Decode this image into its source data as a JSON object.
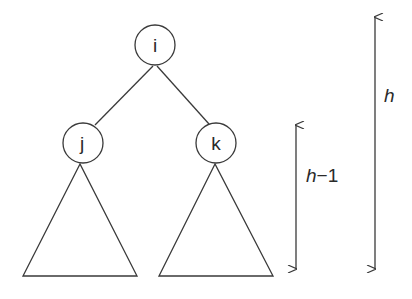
{
  "diagram": {
    "nodes": [
      {
        "id": "i",
        "label": "i",
        "cx": 155,
        "cy": 45,
        "r": 20
      },
      {
        "id": "j",
        "label": "j",
        "cx": 83,
        "cy": 143,
        "r": 20
      },
      {
        "id": "k",
        "label": "k",
        "cx": 216,
        "cy": 143,
        "r": 20
      }
    ],
    "edges": [
      {
        "from": "i",
        "to": "j"
      },
      {
        "from": "i",
        "to": "k"
      }
    ],
    "subtrees": [
      {
        "parent": "j",
        "apex": [
          80,
          164
        ],
        "base_left": [
          23,
          276
        ],
        "base_right": [
          137,
          276
        ]
      },
      {
        "parent": "k",
        "apex": [
          215,
          164
        ],
        "base_left": [
          159,
          276
        ],
        "base_right": [
          273,
          276
        ]
      }
    ],
    "dimensions": [
      {
        "name": "subtree-height",
        "label": "h−1",
        "x": 296,
        "y1": 124,
        "y2": 270
      },
      {
        "name": "tree-height",
        "label": "h",
        "x": 375,
        "y1": 17,
        "y2": 270
      }
    ],
    "colors": {
      "line": "#3a3a3a",
      "text": "#2a2a2a",
      "background": "#ffffff"
    }
  },
  "labels": {
    "root": "i",
    "left_child": "j",
    "right_child": "k",
    "subtree_height_var": "h",
    "subtree_height_rest": "−1",
    "tree_height": "h"
  }
}
